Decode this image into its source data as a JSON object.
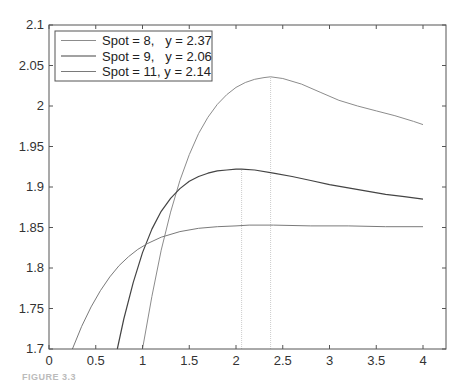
{
  "chart_data": {
    "type": "line",
    "title": "",
    "xlabel": "",
    "ylabel": "",
    "xlim": [
      0,
      4.25
    ],
    "ylim": [
      1.7,
      2.1
    ],
    "grid": false,
    "legend_position": "upper-left",
    "x_ticks": [
      0,
      0.5,
      1,
      1.5,
      2,
      2.5,
      3,
      3.5,
      4
    ],
    "x_tick_labels": [
      "0",
      "0.5",
      "1",
      "1.5",
      "2",
      "2.5",
      "3",
      "3.5",
      "4"
    ],
    "y_ticks": [
      1.7,
      1.75,
      1.8,
      1.85,
      1.9,
      1.95,
      2,
      2.05,
      2.1
    ],
    "y_tick_labels": [
      "1.7",
      "1.75",
      "1.8",
      "1.85",
      "1.9",
      "1.95",
      "2",
      "2.05",
      "2.1"
    ],
    "series": [
      {
        "name": "Spot = 8,   y = 2.37",
        "color": "#8c8c8c",
        "width": 1,
        "peak_x": 2.37,
        "x": [
          1.0,
          1.1,
          1.2,
          1.3,
          1.4,
          1.5,
          1.6,
          1.7,
          1.8,
          1.9,
          2.0,
          2.1,
          2.2,
          2.3,
          2.37,
          2.5,
          2.7,
          2.9,
          3.1,
          3.3,
          3.5,
          3.7,
          3.9,
          4.0
        ],
        "values": [
          1.7,
          1.765,
          1.822,
          1.869,
          1.908,
          1.94,
          1.966,
          1.986,
          2.002,
          2.014,
          2.023,
          2.029,
          2.033,
          2.035,
          2.036,
          2.034,
          2.027,
          2.017,
          2.007,
          2.0,
          1.994,
          1.988,
          1.981,
          1.977
        ]
      },
      {
        "name": "Spot = 9,   y = 2.06",
        "color": "#444444",
        "width": 1.2,
        "peak_x": 2.06,
        "x": [
          0.73,
          0.8,
          0.9,
          1.0,
          1.1,
          1.2,
          1.3,
          1.4,
          1.5,
          1.6,
          1.7,
          1.8,
          1.9,
          2.0,
          2.06,
          2.2,
          2.4,
          2.6,
          2.8,
          3.0,
          3.2,
          3.4,
          3.6,
          3.8,
          4.0
        ],
        "values": [
          1.7,
          1.737,
          1.782,
          1.819,
          1.848,
          1.87,
          1.886,
          1.898,
          1.907,
          1.913,
          1.917,
          1.92,
          1.921,
          1.922,
          1.922,
          1.921,
          1.917,
          1.913,
          1.908,
          1.903,
          1.899,
          1.895,
          1.891,
          1.888,
          1.885
        ]
      },
      {
        "name": "Spot = 11, y = 2.14",
        "color": "#7a7a7a",
        "width": 1,
        "peak_x": 2.14,
        "x": [
          0.25,
          0.35,
          0.45,
          0.55,
          0.65,
          0.75,
          0.85,
          0.95,
          1.05,
          1.2,
          1.4,
          1.6,
          1.8,
          2.0,
          2.14,
          2.4,
          2.8,
          3.2,
          3.6,
          4.0
        ],
        "values": [
          1.7,
          1.728,
          1.752,
          1.772,
          1.789,
          1.803,
          1.814,
          1.823,
          1.83,
          1.838,
          1.845,
          1.849,
          1.851,
          1.852,
          1.853,
          1.853,
          1.852,
          1.852,
          1.851,
          1.851
        ]
      }
    ],
    "reference_lines": [
      {
        "x": 2.06,
        "style": "dotted",
        "color": "#cccccc",
        "to_y": 1.922
      },
      {
        "x": 2.37,
        "style": "dotted",
        "color": "#cccccc",
        "to_y": 2.036
      }
    ]
  },
  "legend": {
    "items": [
      {
        "label": "Spot = 8,   y = 2.37"
      },
      {
        "label": "Spot = 9,   y = 2.06"
      },
      {
        "label": "Spot = 11, y = 2.14"
      }
    ]
  },
  "caption": {
    "text": "FIGURE 3.3"
  }
}
